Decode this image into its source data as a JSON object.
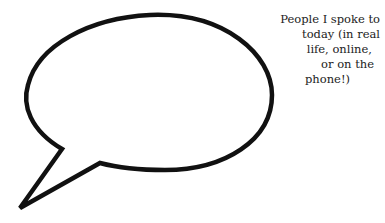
{
  "caption": {
    "lines": [
      "People I spoke to",
      "today (in real",
      "life, online,",
      "or on the",
      "phone!)"
    ]
  },
  "colors": {
    "stroke": "#111111",
    "background": "#ffffff",
    "text": "#222222"
  },
  "bubble": {
    "icon": "speech-bubble-icon"
  }
}
